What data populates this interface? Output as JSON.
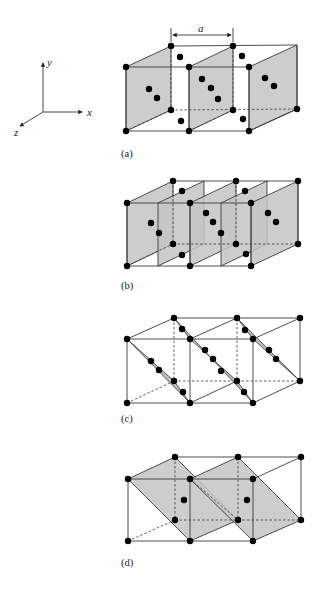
{
  "axes": {
    "x_label": "x",
    "y_label": "y",
    "z_label": "z"
  },
  "dimension": {
    "label": "a"
  },
  "panels": [
    {
      "id": "a",
      "caption": "(a)",
      "description": "planes parallel to yz at x = 0, a, 2a (two FCC cells)"
    },
    {
      "id": "b",
      "caption": "(b)",
      "description": "planes parallel to yz at half-lattice spacing (x = 0, a/2, a, 3a/2, 2a)"
    },
    {
      "id": "c",
      "caption": "(c)",
      "description": "diagonal planes viewed edge-on"
    },
    {
      "id": "d",
      "caption": "(d)",
      "description": "inclined diagonal planes through two cells"
    }
  ],
  "colors": {
    "plane_fill": "#c4c4c4",
    "edge": "#3a3a3a",
    "atom": "#000000"
  }
}
